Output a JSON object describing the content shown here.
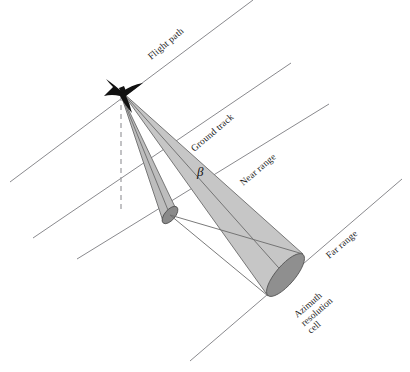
{
  "figure": {
    "type": "technical-diagram",
    "background_color": "#ffffff"
  },
  "colors": {
    "line": "#8a8a8e",
    "beam_fill": "#c6c6c6",
    "beam_stroke": "#6b6b6b",
    "cell_fill": "#8f8f8f",
    "aircraft": "#111111",
    "text": "#1c1c1c"
  },
  "labels": {
    "flight_path": "Flight path",
    "ground_track": "Ground track",
    "near_range": "Near range",
    "far_range": "Far range",
    "beta": "β",
    "azimuth_cell_line1": "Azimuth",
    "azimuth_cell_line2": "resolution",
    "azimuth_cell_line3": "cell"
  },
  "elements": {
    "aircraft": "aircraft-symbol",
    "nadir": "nadir-dashed-line",
    "near_beam": "near-range-beam-cone",
    "far_beam": "far-range-beam-cone",
    "near_cell": "near-range-resolution-cell-ellipse",
    "far_cell": "azimuth-resolution-cell-ellipse"
  },
  "geometry": {
    "aircraft_position": [
      121,
      90
    ],
    "nadir_end": [
      121,
      212
    ],
    "near_cell_center": [
      170,
      215
    ],
    "far_cell_center": [
      286,
      276
    ],
    "line_angle_deg": -40.5
  }
}
